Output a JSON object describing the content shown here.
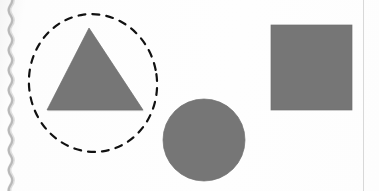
{
  "page": {
    "width": 379,
    "height": 191,
    "background_color": "#fdfdfd",
    "paper_edge_color": "#9a9a9a",
    "margin_rule_color": "#d8d8d8"
  },
  "palette": {
    "shape_fill": "#767676",
    "shape_fill_dark": "#6e6e6e",
    "shape_edge": "#6a6a6a",
    "annotation_stroke": "#111111",
    "paper": "#fdfdfd"
  },
  "artifacts": {
    "binding_edge_label": "scanned-page-binding-edge",
    "right_rule_label": "page-margin-rule"
  },
  "shapes": [
    {
      "id": "triangle",
      "name": "triangle",
      "label": "Triangle",
      "fill": "#767676",
      "selected": true,
      "geometry": {
        "type": "polygon",
        "points": "47,5 47,87 101,87",
        "apex_x": 89,
        "apex_y": 28,
        "base_left_x": 47,
        "base_right_x": 143,
        "base_y": 110,
        "width": 96,
        "height": 82
      }
    },
    {
      "id": "circle",
      "name": "circle",
      "label": "Circle",
      "fill": "#767676",
      "selected": false,
      "geometry": {
        "type": "circle",
        "center_x": 204,
        "center_y": 140,
        "radius": 41,
        "clipped_bottom": true
      }
    },
    {
      "id": "square",
      "name": "square",
      "label": "Square",
      "fill": "#767676",
      "selected": false,
      "geometry": {
        "type": "rect",
        "x": 271,
        "y": 25,
        "width": 81,
        "height": 85
      }
    }
  ],
  "annotation": {
    "id": "selection-circle",
    "name": "dashed-selection-circle",
    "label": "Hand-drawn dashed circle around the triangle",
    "stroke": "#111111",
    "stroke_width": 2.2,
    "dash_pattern": "7 7",
    "encircles": "triangle",
    "geometry": {
      "type": "circle",
      "center_x": 93,
      "center_y": 83,
      "radius_x": 64,
      "radius_y": 69
    }
  }
}
